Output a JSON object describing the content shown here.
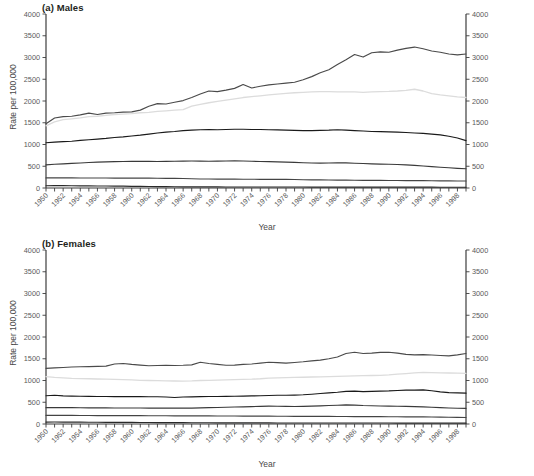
{
  "figure": {
    "xlabel": "Year",
    "ylabel": "Rate per 100,000"
  },
  "panels": {
    "males": {
      "title": "(a) Males"
    },
    "females": {
      "title": "(b) Females"
    }
  },
  "legend": {
    "entries": [
      {
        "label": "85 and over",
        "color": "#4a4a4a"
      },
      {
        "label": "75-84",
        "color": "#dcdcdc"
      },
      {
        "label": "65-74",
        "color": "#1a1a1a"
      },
      {
        "label": "55-64",
        "color": "#3a3a3a"
      },
      {
        "label": "45-54",
        "color": "#444444"
      },
      {
        "label": "20-44",
        "color": "#2a2a2a"
      }
    ]
  },
  "axes": {
    "y_ticks": [
      0,
      500,
      1000,
      1500,
      2000,
      2500,
      3000,
      3500,
      4000
    ],
    "ylim": [
      0,
      4000
    ],
    "xlim": [
      1950,
      1999
    ],
    "x_ticks": [
      1950,
      1952,
      1954,
      1956,
      1958,
      1960,
      1962,
      1964,
      1966,
      1968,
      1970,
      1972,
      1974,
      1976,
      1978,
      1980,
      1982,
      1984,
      1986,
      1988,
      1990,
      1992,
      1994,
      1996,
      1998
    ],
    "grid": false,
    "legend_position": "upper-left of panel (b)"
  },
  "chart_data": [
    {
      "type": "line",
      "title": "(a) Males",
      "xlabel": "Year",
      "ylabel": "Rate per 100,000",
      "ylim": [
        0,
        4000
      ],
      "xlim": [
        1950,
        1999
      ],
      "x": [
        1950,
        1951,
        1952,
        1953,
        1954,
        1955,
        1956,
        1957,
        1958,
        1959,
        1960,
        1961,
        1962,
        1963,
        1964,
        1965,
        1966,
        1967,
        1968,
        1969,
        1970,
        1971,
        1972,
        1973,
        1974,
        1975,
        1976,
        1977,
        1978,
        1979,
        1980,
        1981,
        1982,
        1983,
        1984,
        1985,
        1986,
        1987,
        1988,
        1989,
        1990,
        1991,
        1992,
        1993,
        1994,
        1995,
        1996,
        1997,
        1998,
        1999
      ],
      "series": [
        {
          "name": "85 and over",
          "color": "#4a4a4a",
          "values": [
            1475,
            1610,
            1640,
            1650,
            1680,
            1720,
            1690,
            1720,
            1730,
            1745,
            1750,
            1790,
            1880,
            1940,
            1930,
            1970,
            2010,
            2080,
            2160,
            2230,
            2215,
            2250,
            2290,
            2380,
            2300,
            2340,
            2370,
            2390,
            2410,
            2430,
            2490,
            2560,
            2650,
            2720,
            2840,
            2950,
            3070,
            3010,
            3110,
            3130,
            3120,
            3170,
            3210,
            3240,
            3200,
            3150,
            3120,
            3080,
            3060,
            3080
          ]
        },
        {
          "name": "75-84",
          "color": "#dcdcdc",
          "values": [
            1430,
            1520,
            1570,
            1590,
            1610,
            1640,
            1650,
            1670,
            1690,
            1700,
            1710,
            1730,
            1740,
            1760,
            1775,
            1790,
            1800,
            1880,
            1920,
            1960,
            1990,
            2020,
            2050,
            2080,
            2100,
            2120,
            2140,
            2160,
            2175,
            2190,
            2200,
            2210,
            2215,
            2215,
            2210,
            2210,
            2210,
            2200,
            2210,
            2215,
            2220,
            2230,
            2245,
            2270,
            2230,
            2170,
            2140,
            2120,
            2095,
            2080
          ]
        },
        {
          "name": "65-74",
          "color": "#1a1a1a",
          "values": [
            1040,
            1055,
            1065,
            1075,
            1095,
            1110,
            1125,
            1140,
            1160,
            1175,
            1195,
            1215,
            1240,
            1265,
            1285,
            1300,
            1320,
            1330,
            1340,
            1345,
            1340,
            1345,
            1350,
            1350,
            1345,
            1345,
            1340,
            1335,
            1330,
            1325,
            1320,
            1320,
            1325,
            1330,
            1340,
            1330,
            1320,
            1310,
            1300,
            1295,
            1290,
            1285,
            1275,
            1265,
            1255,
            1240,
            1220,
            1190,
            1150,
            1090
          ]
        },
        {
          "name": "55-64",
          "color": "#3a3a3a",
          "values": [
            530,
            545,
            555,
            565,
            575,
            585,
            595,
            600,
            605,
            610,
            615,
            612,
            615,
            610,
            612,
            615,
            618,
            620,
            618,
            615,
            618,
            620,
            622,
            620,
            615,
            610,
            605,
            600,
            595,
            588,
            580,
            575,
            572,
            575,
            580,
            578,
            570,
            562,
            555,
            550,
            545,
            540,
            530,
            520,
            505,
            490,
            478,
            465,
            452,
            442
          ]
        },
        {
          "name": "45-54",
          "color": "#444444",
          "values": [
            232,
            233,
            233,
            232,
            231,
            230,
            230,
            229,
            228,
            228,
            227,
            226,
            226,
            224,
            222,
            220,
            218,
            212,
            208,
            206,
            205,
            204,
            203,
            202,
            201,
            200,
            200,
            199,
            198,
            195,
            190,
            188,
            186,
            184,
            182,
            180,
            178,
            176,
            175,
            174,
            173,
            172,
            171,
            170,
            169,
            167,
            165,
            163,
            161,
            160
          ]
        },
        {
          "name": "20-44",
          "color": "#2a2a2a",
          "values": [
            52,
            54,
            53,
            52,
            50,
            48,
            46,
            45,
            44,
            42,
            38,
            36,
            34,
            32,
            30,
            28,
            27,
            26,
            26,
            25,
            25,
            24,
            24,
            24,
            23,
            23,
            23,
            22,
            22,
            22,
            22,
            21,
            21,
            21,
            21,
            20,
            20,
            20,
            20,
            20,
            20,
            19,
            19,
            19,
            19,
            19,
            18,
            18,
            18,
            18
          ]
        }
      ]
    },
    {
      "type": "line",
      "title": "(b) Females",
      "xlabel": "Year",
      "ylabel": "Rate per 100,000",
      "ylim": [
        0,
        4000
      ],
      "xlim": [
        1950,
        1999
      ],
      "x": [
        1950,
        1951,
        1952,
        1953,
        1954,
        1955,
        1956,
        1957,
        1958,
        1959,
        1960,
        1961,
        1962,
        1963,
        1964,
        1965,
        1966,
        1967,
        1968,
        1969,
        1970,
        1971,
        1972,
        1973,
        1974,
        1975,
        1976,
        1977,
        1978,
        1979,
        1980,
        1981,
        1982,
        1983,
        1984,
        1985,
        1986,
        1987,
        1988,
        1989,
        1990,
        1991,
        1992,
        1993,
        1994,
        1995,
        1996,
        1997,
        1998,
        1999
      ],
      "series": [
        {
          "name": "85 and over",
          "color": "#4a4a4a",
          "values": [
            1280,
            1290,
            1300,
            1310,
            1315,
            1320,
            1325,
            1330,
            1380,
            1390,
            1370,
            1355,
            1340,
            1345,
            1350,
            1345,
            1350,
            1360,
            1420,
            1390,
            1370,
            1350,
            1355,
            1370,
            1380,
            1400,
            1420,
            1410,
            1400,
            1415,
            1430,
            1450,
            1470,
            1500,
            1540,
            1620,
            1650,
            1620,
            1630,
            1645,
            1650,
            1630,
            1600,
            1590,
            1595,
            1585,
            1575,
            1565,
            1590,
            1620
          ]
        },
        {
          "name": "75-84",
          "color": "#dcdcdc",
          "values": [
            1090,
            1070,
            1060,
            1050,
            1045,
            1040,
            1035,
            1030,
            1025,
            1020,
            1015,
            1005,
            1000,
            995,
            990,
            988,
            985,
            990,
            1000,
            1005,
            1010,
            1015,
            1020,
            1025,
            1030,
            1040,
            1055,
            1060,
            1065,
            1070,
            1075,
            1080,
            1085,
            1090,
            1095,
            1100,
            1105,
            1110,
            1115,
            1120,
            1130,
            1145,
            1160,
            1175,
            1185,
            1180,
            1175,
            1172,
            1168,
            1165
          ]
        },
        {
          "name": "65-74",
          "color": "#1a1a1a",
          "values": [
            650,
            660,
            645,
            640,
            638,
            635,
            633,
            632,
            631,
            630,
            630,
            628,
            627,
            626,
            620,
            610,
            620,
            625,
            630,
            632,
            633,
            635,
            638,
            640,
            645,
            650,
            655,
            660,
            662,
            665,
            672,
            685,
            700,
            715,
            730,
            750,
            755,
            745,
            750,
            755,
            760,
            770,
            780,
            780,
            785,
            765,
            740,
            720,
            715,
            710
          ]
        },
        {
          "name": "55-64",
          "color": "#3a3a3a",
          "values": [
            375,
            380,
            378,
            376,
            374,
            372,
            370,
            370,
            369,
            368,
            368,
            367,
            366,
            365,
            364,
            364,
            364,
            366,
            370,
            375,
            380,
            385,
            390,
            395,
            400,
            405,
            410,
            408,
            405,
            402,
            405,
            412,
            418,
            425,
            432,
            440,
            435,
            425,
            420,
            415,
            412,
            408,
            404,
            400,
            395,
            385,
            375,
            368,
            362,
            358
          ]
        },
        {
          "name": "45-54",
          "color": "#444444",
          "values": [
            198,
            199,
            198,
            197,
            196,
            195,
            194,
            193,
            193,
            192,
            192,
            191,
            190,
            190,
            189,
            188,
            188,
            187,
            186,
            186,
            185,
            184,
            183,
            182,
            181,
            180,
            180,
            179,
            178,
            177,
            176,
            176,
            175,
            174,
            173,
            172,
            171,
            170,
            169,
            168,
            167,
            166,
            165,
            164,
            163,
            160,
            157,
            154,
            152,
            150
          ]
        },
        {
          "name": "20-44",
          "color": "#2a2a2a",
          "values": [
            44,
            45,
            44,
            43,
            42,
            41,
            40,
            39,
            38,
            37,
            36,
            35,
            34,
            33,
            32,
            31,
            30,
            29,
            28,
            28,
            27,
            27,
            26,
            26,
            25,
            25,
            25,
            24,
            24,
            24,
            24,
            23,
            23,
            23,
            23,
            22,
            22,
            22,
            22,
            22,
            22,
            21,
            21,
            21,
            21,
            20,
            20,
            20,
            20,
            20
          ]
        }
      ]
    }
  ]
}
